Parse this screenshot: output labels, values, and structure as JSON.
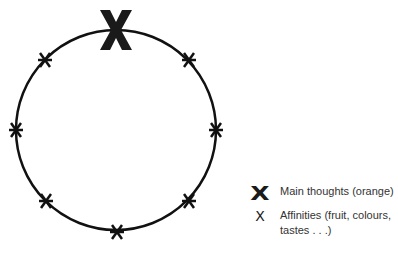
{
  "diagram": {
    "shape": "circle",
    "main_marker": {
      "symbol": "X",
      "position": "top"
    },
    "affinity_markers": [
      "upper-right",
      "right",
      "lower-right",
      "bottom",
      "lower-left",
      "left",
      "upper-left"
    ]
  },
  "legend": {
    "items": [
      {
        "symbol": "X",
        "label": "Main thoughts (orange)"
      },
      {
        "symbol": "X",
        "label": "Affinities (fruit, colours, tastes . . .)"
      }
    ]
  }
}
